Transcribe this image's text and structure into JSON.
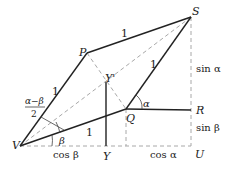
{
  "diagram": {
    "points": {
      "V": {
        "label": "V",
        "x": 20,
        "y": 146
      },
      "P": {
        "label": "P",
        "x": 87,
        "y": 53
      },
      "S": {
        "label": "S",
        "x": 191,
        "y": 17
      },
      "Q": {
        "label": "Q",
        "x": 126,
        "y": 109
      },
      "R": {
        "label": "R",
        "x": 191,
        "y": 110
      },
      "U": {
        "label": "U",
        "x": 191,
        "y": 146
      },
      "Yp": {
        "label": "Y'",
        "x": 106,
        "y": 81
      },
      "Y": {
        "label": "Y",
        "x": 106,
        "y": 146
      }
    },
    "segment_labels": {
      "PS": "1",
      "QS": "1",
      "VP": "1",
      "VQ": "1"
    },
    "angle_labels": {
      "alpha": "α",
      "beta": "β",
      "half_diff_num": "α−β",
      "half_diff_den": "2"
    },
    "measure_labels": {
      "sin_alpha": "sin α",
      "sin_beta": "sin β",
      "cos_beta": "cos β",
      "cos_alpha": "cos α"
    },
    "colors": {
      "solid": "#222222",
      "dashed": "#a8a8a8"
    }
  }
}
